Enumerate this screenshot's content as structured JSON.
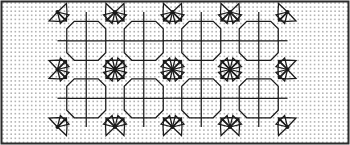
{
  "figure": {
    "kind": "geometric-tessellation-diagram",
    "width": 350,
    "height": 145
  },
  "colors": {
    "background": "#ffffff",
    "dot": "#b4b4b4",
    "ink": "#1a1a1a",
    "border": "#2b2b2b"
  },
  "dot_grid": {
    "name": "dot-grid-paper",
    "spacing": 4.1,
    "dot_size": 1.6,
    "origin_x": 3.0,
    "origin_y": 3.0,
    "visible": true
  },
  "border": {
    "name": "outer-frame",
    "x": 1.5,
    "y": 1.5,
    "width": 347,
    "height": 142,
    "stroke_width": 2.0,
    "visible": true
  },
  "pattern": {
    "name": "octagon-star-tiling",
    "left": 57.5,
    "top": 12.0,
    "cell_width": 57.5,
    "cell_height": 57.5,
    "columns": 4,
    "rows": 2,
    "octagon_half": 19.5,
    "octagon_corner_cut": 7.5,
    "star_point_length": 9.0,
    "star_point_half_width": 8.5,
    "line_width": 1.25,
    "vertex_dot_radius": 2.0,
    "cross_inside_octagon": true,
    "stars_at_interior_vertices": true,
    "stars_at_edge_vertices": true
  },
  "geometry_notes": {
    "motif": "regular octagon with internal cross dividing it into four quadrants",
    "vertex_figure": "eight triangular points radiating from each lattice vertex",
    "edge_vertices": "half and quarter stars along the boundary",
    "grid_vertex_columns": [
      57.5,
      115,
      172.5,
      230,
      287.5
    ],
    "grid_vertex_rows": [
      12,
      69.5,
      127
    ]
  }
}
